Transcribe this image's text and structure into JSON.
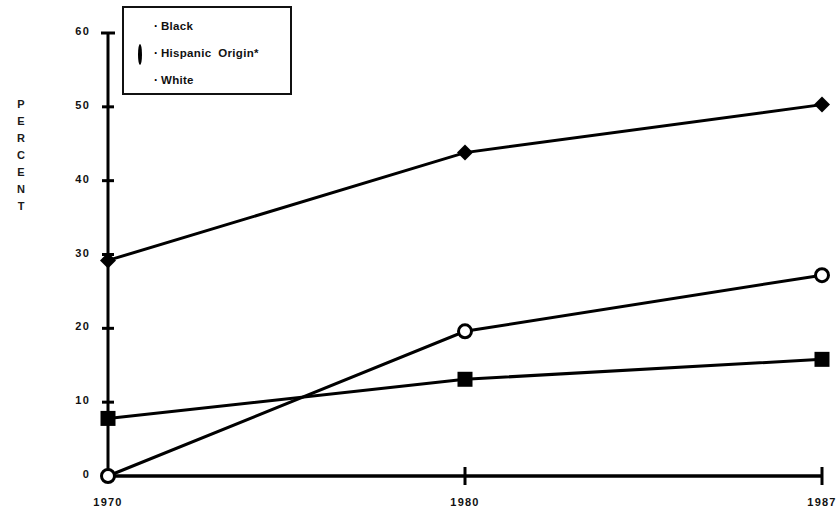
{
  "chart_data": {
    "type": "line",
    "title": "",
    "xlabel": "",
    "ylabel": "PERCENT",
    "x": [
      "1970",
      "1980",
      "1987"
    ],
    "categories": [
      "1970",
      "1980",
      "1987"
    ],
    "xlim": [
      1970,
      1987
    ],
    "ylim": [
      0,
      60
    ],
    "yticks": [
      0,
      10,
      20,
      30,
      40,
      50,
      60
    ],
    "ytick_labels": [
      "0",
      "10",
      "20",
      "30",
      "40",
      "50",
      "60"
    ],
    "xtick_labels": [
      "1970",
      "1980",
      "1987"
    ],
    "grid": false,
    "legend_position": "top-left",
    "series": [
      {
        "name": "Black",
        "marker": "filled-diamond",
        "values": [
          29.2,
          43.8,
          50.3
        ],
        "color": "#000000"
      },
      {
        "name": "Hispanic  Origin*",
        "marker": "open-circle",
        "values": [
          0,
          19.6,
          27.2
        ],
        "color": "#000000"
      },
      {
        "name": "White",
        "marker": "filled-square",
        "values": [
          7.8,
          13.1,
          15.8
        ],
        "color": "#000000"
      }
    ]
  },
  "axis": {
    "y_title_letters": [
      "P",
      "E",
      "R",
      "C",
      "E",
      "N",
      "T"
    ]
  },
  "legend": {
    "items": [
      {
        "label": "Black",
        "separator": "·"
      },
      {
        "label": "Hispanic  Origin*",
        "separator": "·"
      },
      {
        "label": "White",
        "separator": "·"
      }
    ]
  }
}
